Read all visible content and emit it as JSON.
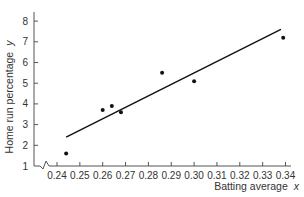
{
  "chart_data": {
    "type": "scatter",
    "title": "",
    "xlabel": "Batting average",
    "xvar": "x",
    "ylabel": "Home run percentage",
    "yvar": "y",
    "xlim": [
      0.23,
      0.345
    ],
    "ylim": [
      1,
      8.3
    ],
    "xticks": [
      "0.24",
      "0.25",
      "0.26",
      "0.27",
      "0.28",
      "0.29",
      "0.30",
      "0.31",
      "0.32",
      "0.33",
      "0.34"
    ],
    "yticks": [
      "1",
      "2",
      "3",
      "4",
      "5",
      "6",
      "7",
      "8"
    ],
    "x_axis_break": true,
    "grid": false,
    "series": [
      {
        "name": "observations",
        "x": [
          0.244,
          0.26,
          0.264,
          0.268,
          0.286,
          0.3,
          0.339
        ],
        "y": [
          1.6,
          3.7,
          3.9,
          3.6,
          5.5,
          5.1,
          7.2
        ]
      }
    ],
    "regression_line": {
      "x_start": 0.244,
      "y_start": 2.4,
      "x_end": 0.338,
      "y_end": 7.6
    }
  },
  "colors": {
    "axis": "#555555",
    "points": "#111111",
    "line": "#111111",
    "text": "#333333"
  }
}
